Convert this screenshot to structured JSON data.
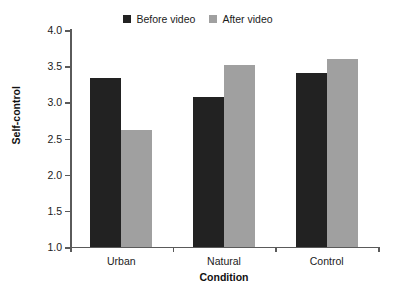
{
  "chart_data": {
    "type": "bar",
    "title": "",
    "xlabel": "Condition",
    "ylabel": "Self-control",
    "categories": [
      "Urban",
      "Natural",
      "Control"
    ],
    "series": [
      {
        "name": "Before video",
        "color": "#222222",
        "values": [
          3.33,
          3.07,
          3.4
        ]
      },
      {
        "name": "After video",
        "color": "#a0a0a0",
        "values": [
          2.62,
          3.52,
          3.6
        ]
      }
    ],
    "ylim": [
      1.0,
      4.0
    ],
    "ytick_labels": [
      "1.0",
      "1.5",
      "2.0",
      "2.5",
      "3.0",
      "3.5",
      "4.0"
    ],
    "ytick_values": [
      1.0,
      1.5,
      2.0,
      2.5,
      3.0,
      3.5,
      4.0
    ],
    "grid": false,
    "legend_position": "top-center",
    "axis_color": "#5a5a5a"
  }
}
